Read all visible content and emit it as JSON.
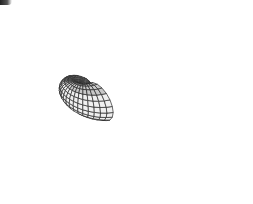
{
  "figure": {
    "colors": {
      "background": "#ffffff",
      "surface_light": "#f0f0f0",
      "surface_mid": "#e2e2e2",
      "surface_dark": "#cfcfcf",
      "rim_band": "#c9c9c9",
      "wire": "#2a2a2a",
      "corner_mark": "#333333"
    },
    "apex": {
      "x": 83,
      "y": 88
    }
  }
}
